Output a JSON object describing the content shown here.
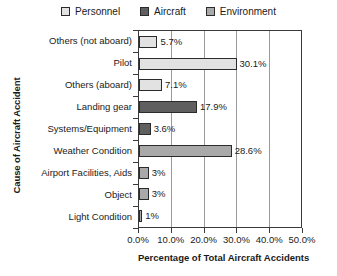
{
  "chart_data": {
    "type": "bar",
    "orientation": "horizontal",
    "title": "",
    "xlabel": "Percentage of Total Aircraft Accidents",
    "ylabel": "Cause of Aircraft Accident",
    "xlim": [
      0,
      50
    ],
    "grid": true,
    "legend_position": "top-center",
    "categories": [
      "Others (not aboard)",
      "Pilot",
      "Others (aboard)",
      "Landing gear",
      "Systems/Equipment",
      "Weather Condition",
      "Airport Facilities, Aids",
      "Object",
      "Light Condition"
    ],
    "values": [
      5.7,
      30.1,
      7.1,
      17.9,
      3.6,
      28.6,
      3,
      3,
      1
    ],
    "value_labels": [
      "5.7%",
      "30.1%",
      "7.1%",
      "17.9%",
      "3.6%",
      "28.6%",
      "3%",
      "3%",
      "1%"
    ],
    "series_of_category": [
      "Personnel",
      "Personnel",
      "Personnel",
      "Aircraft",
      "Aircraft",
      "Environment",
      "Environment",
      "Environment",
      "Environment"
    ],
    "xticks": [
      0,
      10,
      20,
      30,
      40,
      50
    ],
    "xtick_labels": [
      "0.0%",
      "10.0%",
      "20.0%",
      "30.0%",
      "40.0%",
      "50.0%"
    ],
    "legend": [
      {
        "label": "Personnel",
        "color": "#e2e2e2"
      },
      {
        "label": "Aircraft",
        "color": "#5f5f5f"
      },
      {
        "label": "Environment",
        "color": "#a9a9a9"
      }
    ],
    "colors": {
      "Personnel": "#e2e2e2",
      "Aircraft": "#5f5f5f",
      "Environment": "#a9a9a9",
      "bar_border": "#2b2b2b",
      "axis": "#3a3a3a",
      "gridline": "#9a9a9a",
      "background": "#ffffff",
      "text": "#1a1a1a"
    }
  }
}
